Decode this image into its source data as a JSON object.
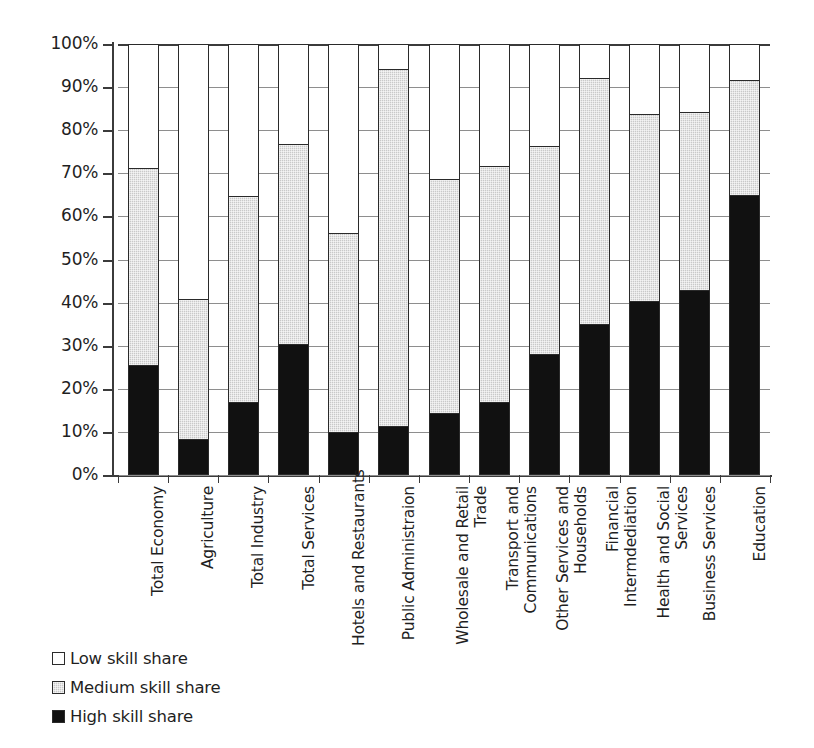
{
  "chart_data": {
    "type": "bar",
    "subtype": "stacked-100-percent-vertical",
    "title": "",
    "xlabel": "",
    "ylabel": "",
    "ylim": [
      0,
      100
    ],
    "ytick_labels": [
      "0%",
      "10%",
      "20%",
      "30%",
      "40%",
      "50%",
      "60%",
      "70%",
      "80%",
      "90%",
      "100%"
    ],
    "ytick_values": [
      0,
      10,
      20,
      30,
      40,
      50,
      60,
      70,
      80,
      90,
      100
    ],
    "grid": true,
    "grid_axis": "y",
    "legend_position": "bottom-left",
    "categories": [
      "Total Economy",
      "Agriculture",
      "Total Industry",
      "Total Services",
      "Hotels and Restaurants",
      "Public Administraion",
      "Wholesale and Retail Trade",
      "Transport and Communications",
      "Other Services and Households",
      "Financial Intermdediation",
      "Health and Social Services",
      "Business Services",
      "Education"
    ],
    "category_label_lines": [
      [
        "Total Economy"
      ],
      [
        "Agriculture"
      ],
      [
        "Total Industry"
      ],
      [
        "Total Services"
      ],
      [
        "Hotels and Restaurants"
      ],
      [
        "Public Administraion"
      ],
      [
        "Wholesale and Retail",
        "Trade"
      ],
      [
        "Transport and",
        "Communications"
      ],
      [
        "Other Services and",
        "Households"
      ],
      [
        "Financial",
        "Intermdediation"
      ],
      [
        "Health and Social",
        "Services"
      ],
      [
        "Business Services"
      ],
      [
        "Education"
      ]
    ],
    "series": [
      {
        "name": "High skill share",
        "color": "#111111",
        "values": [
          25.0,
          8.0,
          16.5,
          30.0,
          9.5,
          11.0,
          14.0,
          16.5,
          27.5,
          34.5,
          40.0,
          42.5,
          64.5
        ]
      },
      {
        "name": "Medium skill share",
        "color": "#c9c9c9",
        "values": [
          46.0,
          32.5,
          48.0,
          46.5,
          46.5,
          83.0,
          54.5,
          55.0,
          48.5,
          57.5,
          43.5,
          41.5,
          27.0
        ]
      },
      {
        "name": "Low skill share",
        "color": "#ffffff",
        "values": [
          29.0,
          59.5,
          35.5,
          23.5,
          44.0,
          6.0,
          31.5,
          28.5,
          24.0,
          8.0,
          16.5,
          16.0,
          8.5
        ]
      }
    ],
    "cumulative_tops": {
      "high": [
        25.0,
        8.0,
        16.5,
        30.0,
        9.5,
        11.0,
        14.0,
        16.5,
        27.5,
        34.5,
        40.0,
        42.5,
        64.5
      ],
      "high_plus_medium": [
        71.0,
        40.5,
        64.5,
        76.5,
        56.0,
        94.0,
        68.5,
        71.5,
        76.0,
        92.0,
        83.5,
        84.0,
        91.5
      ]
    }
  },
  "legend": {
    "items": [
      {
        "label": "Low skill share",
        "swatch": "sw-low"
      },
      {
        "label": "Medium skill share",
        "swatch": "sw-medium"
      },
      {
        "label": "High skill share",
        "swatch": "sw-high"
      }
    ]
  }
}
